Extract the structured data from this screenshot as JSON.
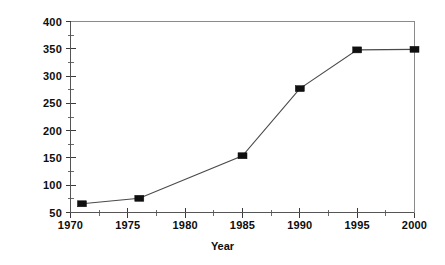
{
  "chart_data": {
    "type": "line",
    "title": "",
    "subtitle": "",
    "xlabel": "Year",
    "ylabel": "# of Fields",
    "x": [
      1971,
      1976,
      1985,
      1990,
      1995,
      2000
    ],
    "values": [
      66,
      76,
      154,
      277,
      348,
      349
    ],
    "series": [
      {
        "name": "# of Fields",
        "x": [
          1971,
          1976,
          1985,
          1990,
          1995,
          2000
        ],
        "values": [
          66,
          76,
          154,
          277,
          348,
          349
        ],
        "marker": "filled-square",
        "marker_color": "#101010",
        "line_color": "#4a4a4a"
      }
    ],
    "xlim": [
      1970,
      2000
    ],
    "ylim": [
      50,
      400
    ],
    "xticks": [
      1970,
      1975,
      1980,
      1985,
      1990,
      1995,
      2000
    ],
    "xtick_labels": [
      "1970",
      "1975",
      "1980",
      "1985",
      "1990",
      "1995",
      "2000"
    ],
    "x_minor_tick_interval": 2.5,
    "yticks": [
      50,
      100,
      150,
      200,
      250,
      300,
      350,
      400
    ],
    "ytick_labels": [
      "50",
      "100",
      "150",
      "200",
      "250",
      "300",
      "350",
      "400"
    ],
    "y_minor_tick_interval": 25,
    "grid": false,
    "legend": null,
    "legend_position": "none",
    "annotations": [],
    "background_color": "#ffffff",
    "frame": "box"
  },
  "figure": {
    "x_axis_title": "Year",
    "y_axis_title": "# of Fields"
  }
}
